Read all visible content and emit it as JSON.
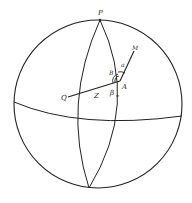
{
  "diagram": {
    "type": "celestial-sphere",
    "colors": {
      "stroke": "#222222",
      "background": "#ffffff"
    },
    "labels": {
      "pole": "P",
      "point_q": "Q",
      "point_a": "A",
      "point_m": "M",
      "arc_z": "Z",
      "angle_b": "B",
      "angle_alpha": "a",
      "angle_beta": "β",
      "beta_subscript": "*"
    }
  }
}
